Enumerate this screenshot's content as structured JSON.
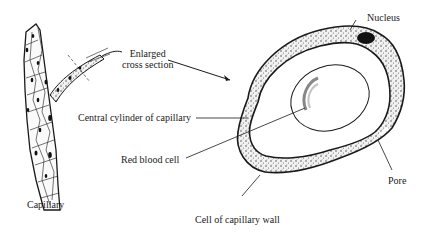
{
  "diagram": {
    "labels": {
      "enlarged_line1": "Enlarged",
      "enlarged_line2": "cross section",
      "nucleus": "Nucleus",
      "central_cylinder": "Central cylinder of capillary",
      "red_blood_cell": "Red blood cell",
      "capillary": "Capillary",
      "pore": "Pore",
      "cell_wall": "Cell of capillary wall"
    },
    "colors": {
      "ink": "#1a1a1a",
      "background": "#ffffff",
      "stipple": "#555555"
    }
  }
}
